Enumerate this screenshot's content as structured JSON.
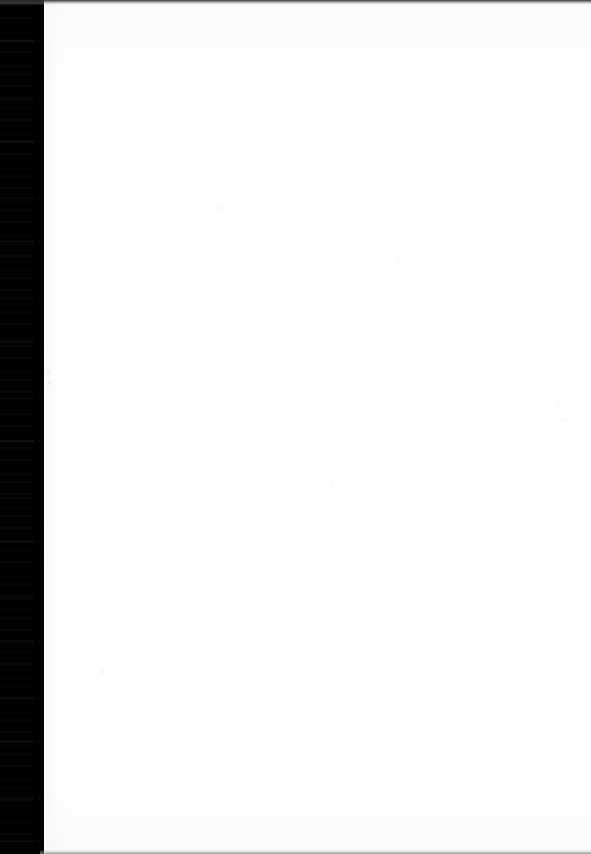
{
  "document": {
    "kind": "scanned-page",
    "page_state": "blank",
    "visible_text": "",
    "width_px": 591,
    "height_px": 854
  },
  "colors": {
    "gutter": "#000000",
    "paper": "#ffffff",
    "paper_shade": "#e4e5e8",
    "top_edge": "#28282a",
    "bottom_rule": "#78787c",
    "speck": "#b9bcc4"
  },
  "regions": {
    "gutter": {
      "name": "scanner-gutter",
      "left_px": 0,
      "top_px": 0,
      "width_px": 44,
      "height_px": 854
    },
    "paper": {
      "name": "page-body",
      "left_px": 44,
      "top_px": 0,
      "width_px": 547,
      "height_px": 854
    },
    "top_edge": {
      "name": "top-scan-edge",
      "height_px": 5
    },
    "bottom_edge": {
      "name": "bottom-scan-rule",
      "left_px": 40,
      "height_px": 4
    }
  },
  "specks": [
    {
      "x": 45,
      "y": 370,
      "w": 5,
      "h": 5,
      "opacity": 0.3
    },
    {
      "x": 46,
      "y": 381,
      "w": 5,
      "h": 4,
      "opacity": 0.26
    },
    {
      "x": 44,
      "y": 344,
      "w": 3,
      "h": 3,
      "opacity": 0.16
    },
    {
      "x": 44,
      "y": 520,
      "w": 3,
      "h": 6,
      "opacity": 0.14
    },
    {
      "x": 45,
      "y": 556,
      "w": 4,
      "h": 4,
      "opacity": 0.18
    },
    {
      "x": 45,
      "y": 564,
      "w": 3,
      "h": 3,
      "opacity": 0.15
    },
    {
      "x": 100,
      "y": 668,
      "w": 4,
      "h": 6,
      "opacity": 0.1
    },
    {
      "x": 220,
      "y": 204,
      "w": 3,
      "h": 7,
      "opacity": 0.09
    },
    {
      "x": 396,
      "y": 260,
      "w": 4,
      "h": 3,
      "opacity": 0.08
    },
    {
      "x": 557,
      "y": 403,
      "w": 5,
      "h": 3,
      "opacity": 0.09
    },
    {
      "x": 561,
      "y": 418,
      "w": 5,
      "h": 3,
      "opacity": 0.07
    },
    {
      "x": 330,
      "y": 483,
      "w": 3,
      "h": 3,
      "opacity": 0.07
    },
    {
      "x": 150,
      "y": 484,
      "w": 3,
      "h": 3,
      "opacity": 0.07
    },
    {
      "x": 497,
      "y": 495,
      "w": 4,
      "h": 3,
      "opacity": 0.07
    },
    {
      "x": 513,
      "y": 548,
      "w": 3,
      "h": 3,
      "opacity": 0.06
    },
    {
      "x": 511,
      "y": 690,
      "w": 3,
      "h": 3,
      "opacity": 0.07
    },
    {
      "x": 390,
      "y": 761,
      "w": 3,
      "h": 3,
      "opacity": 0.06
    },
    {
      "x": 283,
      "y": 790,
      "w": 3,
      "h": 3,
      "opacity": 0.06
    }
  ]
}
